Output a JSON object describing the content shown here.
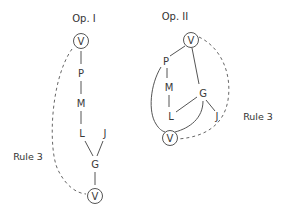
{
  "diagrams": [
    {
      "id": "op1",
      "title": "Op. I",
      "rule_label": "Rule 3",
      "nodes": {
        "top": "V",
        "p": "P",
        "m": "M",
        "l": "L",
        "j": "J",
        "g": "G",
        "bottom": "V"
      },
      "edges": [
        [
          "V",
          "P"
        ],
        [
          "P",
          "M"
        ],
        [
          "M",
          "L"
        ],
        [
          "L",
          "G"
        ],
        [
          "J",
          "G"
        ],
        [
          "G",
          "V"
        ]
      ],
      "dashed_edge": {
        "from": "V (top)",
        "to": "V (bottom)",
        "label": "Rule 3"
      }
    },
    {
      "id": "op2",
      "title": "Op. II",
      "rule_label": "Rule 3",
      "nodes": {
        "top": "V",
        "p": "P",
        "m": "M",
        "l": "L",
        "g": "G",
        "j": "J",
        "bottom": "V"
      },
      "edges": [
        [
          "V",
          "P"
        ],
        [
          "P",
          "M"
        ],
        [
          "M",
          "L"
        ],
        [
          "V",
          "G"
        ],
        [
          "G",
          "L"
        ],
        [
          "G",
          "J"
        ],
        [
          "G",
          "V (bottom)"
        ],
        [
          "P",
          "V (bottom)"
        ],
        [
          "L",
          "V (bottom)"
        ]
      ],
      "dashed_edge": {
        "from": "V (top)",
        "to": "V (bottom)",
        "label": "Rule 3"
      }
    }
  ]
}
